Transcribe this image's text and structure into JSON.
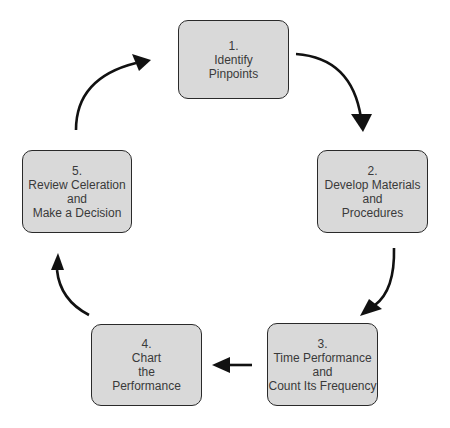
{
  "diagram": {
    "type": "cycle",
    "box_fill": "#d9d9d9",
    "box_border": "#2a2a2a",
    "arrow_color": "#111111",
    "steps": [
      {
        "number": "1.",
        "lines": [
          "Identify",
          "Pinpoints"
        ]
      },
      {
        "number": "2.",
        "lines": [
          "Develop Materials",
          "and",
          "Procedures"
        ]
      },
      {
        "number": "3.",
        "lines": [
          "Time Performance",
          "and",
          "Count Its Frequency"
        ]
      },
      {
        "number": "4.",
        "lines": [
          "Chart",
          "the",
          "Performance"
        ]
      },
      {
        "number": "5.",
        "lines": [
          "Review Celeration",
          "and",
          "Make a Decision"
        ]
      }
    ],
    "flow": [
      {
        "from": "1",
        "to": "2"
      },
      {
        "from": "2",
        "to": "3"
      },
      {
        "from": "3",
        "to": "4"
      },
      {
        "from": "4",
        "to": "5"
      },
      {
        "from": "5",
        "to": "1"
      }
    ]
  }
}
